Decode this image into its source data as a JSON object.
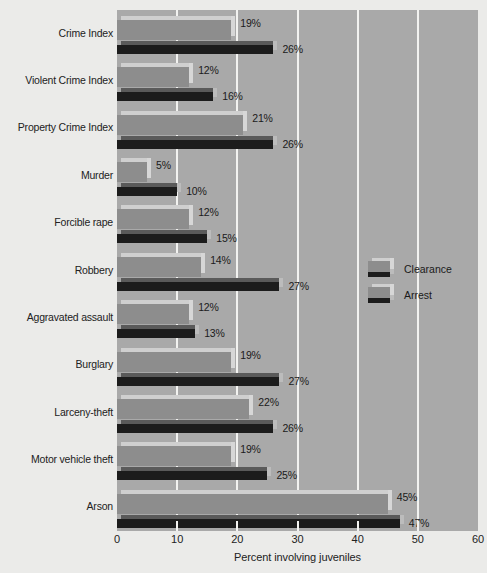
{
  "chart_data": {
    "type": "bar",
    "orientation": "horizontal",
    "title": "",
    "xlabel": "Percent involving juveniles",
    "ylabel": "",
    "xlim": [
      0,
      60
    ],
    "xticks": [
      0,
      10,
      20,
      30,
      40,
      50,
      60
    ],
    "grid": true,
    "legend_position": "middle-right",
    "categories": [
      "Crime Index",
      "Violent Crime Index",
      "Property Crime Index",
      "Murder",
      "Forcible rape",
      "Robbery",
      "Aggravated assault",
      "Burglary",
      "Larceny-theft",
      "Motor vehicle theft",
      "Arson"
    ],
    "series": [
      {
        "name": "Clearance",
        "color": "#8d8d8d",
        "values": [
          19,
          12,
          21,
          5,
          12,
          14,
          12,
          19,
          22,
          19,
          45
        ],
        "labels": [
          "19%",
          "12%",
          "21%",
          "5%",
          "12%",
          "14%",
          "12%",
          "19%",
          "22%",
          "19%",
          "45%"
        ]
      },
      {
        "name": "Arrest",
        "color": "#1c1c1c",
        "values": [
          26,
          16,
          26,
          10,
          15,
          27,
          13,
          27,
          26,
          25,
          47
        ],
        "labels": [
          "26%",
          "16%",
          "26%",
          "10%",
          "15%",
          "27%",
          "13%",
          "27%",
          "26%",
          "25%",
          "47%"
        ]
      }
    ]
  },
  "colors": {
    "page_background": "#ebebe9",
    "plot_background": "#a9a9a9",
    "gridline": "#f2f2f0",
    "clearance_bar": "#8d8d8d",
    "arrest_bar": "#1c1c1c",
    "text": "#1a1a1a"
  }
}
